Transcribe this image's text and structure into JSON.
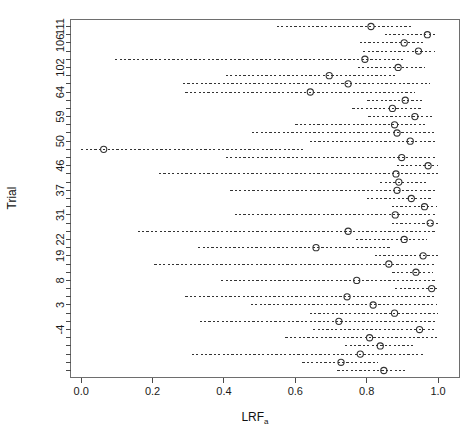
{
  "figure": {
    "title_fragment": "",
    "background": "#ffffff"
  },
  "chart_data": {
    "type": "scatter",
    "subtype": "forest-plot",
    "title": "",
    "xlabel": "LRF",
    "xlabel_subscript": "a",
    "ylabel": "Trial",
    "xlim": [
      -0.03,
      1.06
    ],
    "ylim": [
      0.5,
      38.5
    ],
    "grid": false,
    "legend": "none",
    "xticks": [
      0.0,
      0.2,
      0.4,
      0.6,
      0.8,
      1.0
    ],
    "xticklabels": [
      "0.0",
      "0.2",
      "0.4",
      "0.6",
      "0.8",
      "1.0"
    ],
    "ytick_positions": [
      38,
      36,
      34,
      31,
      29,
      26,
      24,
      21,
      19,
      16,
      14,
      11,
      9,
      6
    ],
    "yticklabels": [
      "111",
      "106",
      "102",
      "64",
      "59",
      "50",
      "46",
      "37",
      "31",
      "22",
      "19",
      "8",
      "3",
      "-4"
    ],
    "marker": "open-circle",
    "error_style": "dashed",
    "point_color": "#333333",
    "line_color": "#333333",
    "rows": [
      {
        "trial": "111",
        "estimate": 0.812,
        "lower": 0.548,
        "upper": 0.925
      },
      {
        "trial": "",
        "estimate": 0.97,
        "lower": 0.85,
        "upper": 0.992
      },
      {
        "trial": "106",
        "estimate": 0.905,
        "lower": 0.78,
        "upper": 0.96
      },
      {
        "trial": "",
        "estimate": 0.945,
        "lower": 0.79,
        "upper": 0.99
      },
      {
        "trial": "",
        "estimate": 0.795,
        "lower": 0.095,
        "upper": 0.905
      },
      {
        "trial": "102",
        "estimate": 0.888,
        "lower": 0.775,
        "upper": 0.962
      },
      {
        "trial": "",
        "estimate": 0.695,
        "lower": 0.405,
        "upper": 0.885
      },
      {
        "trial": "",
        "estimate": 0.748,
        "lower": 0.285,
        "upper": 0.978
      },
      {
        "trial": "64",
        "estimate": 0.642,
        "lower": 0.292,
        "upper": 0.935
      },
      {
        "trial": "",
        "estimate": 0.908,
        "lower": 0.802,
        "upper": 0.958
      },
      {
        "trial": "",
        "estimate": 0.872,
        "lower": 0.76,
        "upper": 0.952
      },
      {
        "trial": "59",
        "estimate": 0.935,
        "lower": 0.805,
        "upper": 0.988
      },
      {
        "trial": "",
        "estimate": 0.878,
        "lower": 0.6,
        "upper": 0.968
      },
      {
        "trial": "",
        "estimate": 0.885,
        "lower": 0.478,
        "upper": 0.995
      },
      {
        "trial": "50",
        "estimate": 0.922,
        "lower": 0.64,
        "upper": 0.998
      },
      {
        "trial": "",
        "estimate": 0.063,
        "lower": 0.0,
        "upper": 0.625
      },
      {
        "trial": "",
        "estimate": 0.898,
        "lower": 0.405,
        "upper": 0.992
      },
      {
        "trial": "46",
        "estimate": 0.972,
        "lower": 0.885,
        "upper": 1.0
      },
      {
        "trial": "",
        "estimate": 0.882,
        "lower": 0.218,
        "upper": 1.0
      },
      {
        "trial": "",
        "estimate": 0.89,
        "lower": 0.838,
        "upper": 0.972
      },
      {
        "trial": "37",
        "estimate": 0.885,
        "lower": 0.418,
        "upper": 0.99
      },
      {
        "trial": "",
        "estimate": 0.925,
        "lower": 0.8,
        "upper": 0.985
      },
      {
        "trial": "",
        "estimate": 0.962,
        "lower": 0.87,
        "upper": 0.998
      },
      {
        "trial": "31",
        "estimate": 0.88,
        "lower": 0.43,
        "upper": 0.99
      },
      {
        "trial": "",
        "estimate": 0.978,
        "lower": 0.87,
        "upper": 1.0
      },
      {
        "trial": "",
        "estimate": 0.748,
        "lower": 0.158,
        "upper": 0.998
      },
      {
        "trial": "22",
        "estimate": 0.905,
        "lower": 0.77,
        "upper": 0.968
      },
      {
        "trial": "",
        "estimate": 0.658,
        "lower": 0.328,
        "upper": 0.87
      },
      {
        "trial": "19",
        "estimate": 0.958,
        "lower": 0.822,
        "upper": 1.0
      },
      {
        "trial": "",
        "estimate": 0.862,
        "lower": 0.205,
        "upper": 0.995
      },
      {
        "trial": "",
        "estimate": 0.938,
        "lower": 0.872,
        "upper": 0.985
      },
      {
        "trial": "8",
        "estimate": 0.772,
        "lower": 0.392,
        "upper": 0.992
      },
      {
        "trial": "",
        "estimate": 0.982,
        "lower": 0.88,
        "upper": 1.0
      },
      {
        "trial": "",
        "estimate": 0.745,
        "lower": 0.292,
        "upper": 0.995
      },
      {
        "trial": "3",
        "estimate": 0.818,
        "lower": 0.475,
        "upper": 0.998
      },
      {
        "trial": "",
        "estimate": 0.878,
        "lower": 0.64,
        "upper": 1.0
      },
      {
        "trial": "",
        "estimate": 0.722,
        "lower": 0.332,
        "upper": 0.998
      },
      {
        "trial": "-4",
        "estimate": 0.948,
        "lower": 0.65,
        "upper": 0.992
      },
      {
        "trial": "",
        "estimate": 0.808,
        "lower": 0.572,
        "upper": 0.998
      },
      {
        "trial": "",
        "estimate": 0.838,
        "lower": 0.74,
        "upper": 0.93
      },
      {
        "trial": "",
        "estimate": 0.782,
        "lower": 0.31,
        "upper": 0.962
      },
      {
        "trial": "",
        "estimate": 0.728,
        "lower": 0.62,
        "upper": 0.832
      },
      {
        "trial": "",
        "estimate": 0.848,
        "lower": 0.718,
        "upper": 0.908
      }
    ]
  }
}
